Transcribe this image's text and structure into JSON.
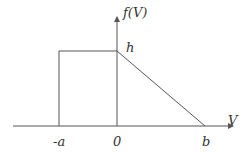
{
  "diagram": {
    "type": "probability-density-function",
    "y_axis_label": "f(V)",
    "x_axis_label": "V",
    "peak_label": "h",
    "x_ticks": [
      {
        "label": "-a"
      },
      {
        "label": "0"
      },
      {
        "label": "b"
      }
    ],
    "shape": {
      "segment_1": "constant f(V)=h for -a ≤ V ≤ 0",
      "segment_2": "linear decrease from h at V=0 to 0 at V=b"
    },
    "colors": {
      "line": "#555555",
      "text": "#333333",
      "background": "#ffffff"
    }
  }
}
